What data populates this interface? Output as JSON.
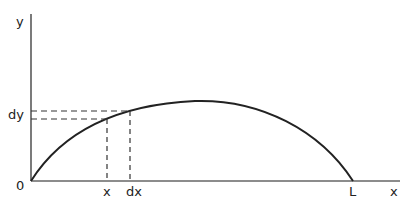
{
  "diagram": {
    "type": "arc-curve-with-differential",
    "axes": {
      "y_label": "y",
      "x_label": "x",
      "origin_label": "0",
      "end_label": "L"
    },
    "markers": {
      "x_label": "x",
      "dx_label": "dx",
      "dy_label": "dy"
    },
    "colors": {
      "line": "#222222",
      "axis": "#555555",
      "background": "#ffffff"
    }
  }
}
